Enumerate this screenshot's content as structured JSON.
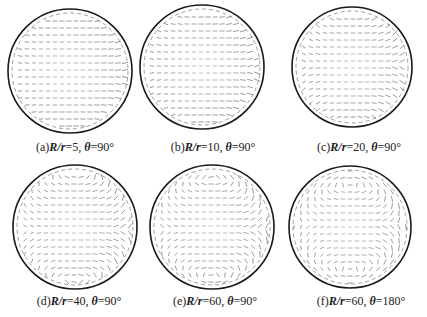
{
  "figure": {
    "circle_stroke": "#1a1a1a",
    "vector_color": "#555555",
    "panels": [
      {
        "id": "a",
        "label": "(a)",
        "ratio_label": "R/r",
        "ratio_value": "=5,",
        "angle_symbol": "θ",
        "angle_value": "=90°",
        "cx": 70,
        "cy": 71,
        "r": 62,
        "cap_x": 70,
        "cap_y": 148,
        "swirl": 0.2
      },
      {
        "id": "b",
        "label": "(b)",
        "ratio_label": "R/r",
        "ratio_value": "=10,",
        "angle_symbol": "θ",
        "angle_value": "=90°",
        "cx": 202,
        "cy": 67,
        "r": 62,
        "cap_x": 212,
        "cap_y": 148,
        "swirl": 0.3
      },
      {
        "id": "c",
        "label": "(c)",
        "ratio_label": "R/r",
        "ratio_value": "=20,",
        "angle_symbol": "θ",
        "angle_value": "=90°",
        "cx": 352,
        "cy": 67,
        "r": 60,
        "cap_x": 358,
        "cap_y": 148,
        "swirl": 0.45
      },
      {
        "id": "d",
        "label": "(d)",
        "ratio_label": "R/r",
        "ratio_value": "=40,",
        "angle_symbol": "θ",
        "angle_value": "=90°",
        "cx": 75,
        "cy": 227,
        "r": 62,
        "cap_x": 78,
        "cap_y": 302,
        "swirl": 0.6
      },
      {
        "id": "e",
        "label": "(e)",
        "ratio_label": "R/r",
        "ratio_value": "=60,",
        "angle_symbol": "θ",
        "angle_value": "=90°",
        "cx": 212,
        "cy": 227,
        "r": 62,
        "cap_x": 214,
        "cap_y": 302,
        "swirl": 0.75
      },
      {
        "id": "f",
        "label": "(f)",
        "ratio_label": "R/r",
        "ratio_value": "=60,",
        "angle_symbol": "θ",
        "angle_value": "=180°",
        "cx": 350,
        "cy": 227,
        "r": 61,
        "cap_x": 360,
        "cap_y": 302,
        "swirl": 1.0
      }
    ]
  }
}
